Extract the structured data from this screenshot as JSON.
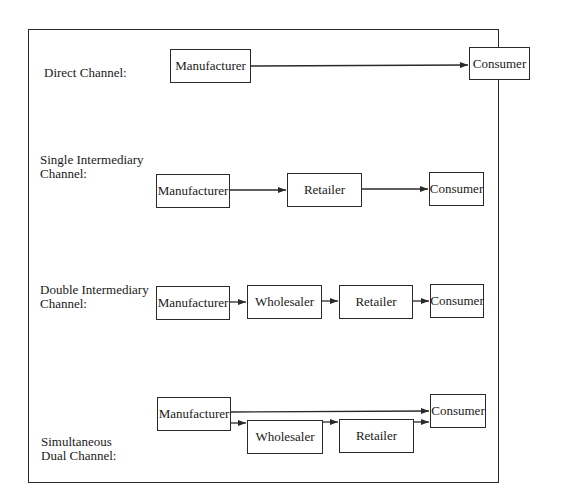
{
  "diagram": {
    "rows": [
      {
        "label": "Direct Channel:",
        "nodes": [
          "Manufacturer",
          "Consumer"
        ]
      },
      {
        "label": "Single Intermediary\nChannel:",
        "nodes": [
          "Manufacturer",
          "Retailer",
          "Consumer"
        ]
      },
      {
        "label": "Double Intermediary\nChannel:",
        "nodes": [
          "Manufacturer",
          "Wholesaler",
          "Retailer",
          "Consumer"
        ]
      },
      {
        "label": "Simultaneous\nDual Channel:",
        "nodes": [
          "Manufacturer",
          "Wholesaler",
          "Retailer",
          "Consumer"
        ]
      }
    ],
    "colors": {
      "stroke": "#2a2a2a",
      "text": "#1a1a1a",
      "background": "#ffffff"
    }
  }
}
